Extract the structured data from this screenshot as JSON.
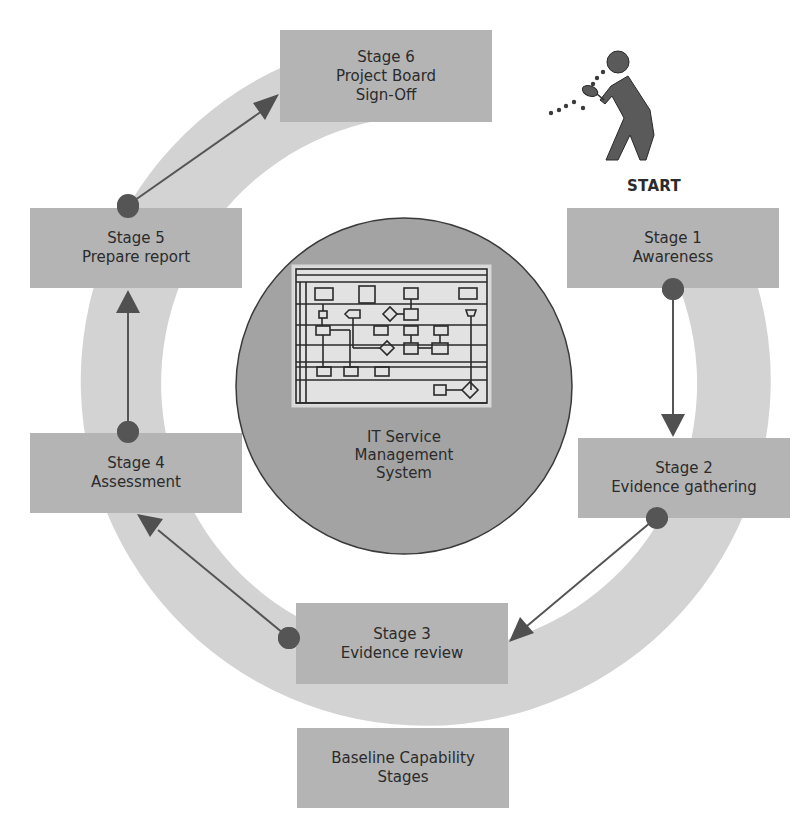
{
  "diagram": {
    "type": "cycle",
    "start_label": "START",
    "center": {
      "lines": [
        "IT Service",
        "Management",
        "System"
      ],
      "icon": "flowchart-icon"
    },
    "stages": [
      {
        "id": "stage-1",
        "lines": [
          "Stage 1",
          "Awareness"
        ]
      },
      {
        "id": "stage-2",
        "lines": [
          "Stage 2",
          "Evidence gathering"
        ]
      },
      {
        "id": "stage-3",
        "lines": [
          "Stage 3",
          "Evidence review"
        ]
      },
      {
        "id": "stage-4",
        "lines": [
          "Stage 4",
          "Assessment"
        ]
      },
      {
        "id": "stage-5",
        "lines": [
          "Stage 5",
          "Prepare report"
        ]
      },
      {
        "id": "stage-6",
        "lines": [
          "Stage 6",
          "Project Board",
          "Sign-Off"
        ]
      }
    ],
    "legend": {
      "lines": [
        "Baseline Capability",
        "Stages"
      ]
    },
    "flow": [
      {
        "from": "stage-1",
        "to": "stage-2"
      },
      {
        "from": "stage-2",
        "to": "stage-3"
      },
      {
        "from": "stage-3",
        "to": "stage-4"
      },
      {
        "from": "stage-4",
        "to": "stage-5"
      },
      {
        "from": "stage-5",
        "to": "stage-6"
      }
    ],
    "colors": {
      "ring": "#d3d3d3",
      "box": "#b4b4b4",
      "center_circle": "#a3a3a3",
      "arrow": "#505050",
      "dot": "#555555",
      "figure": "#5a5a5a"
    }
  }
}
